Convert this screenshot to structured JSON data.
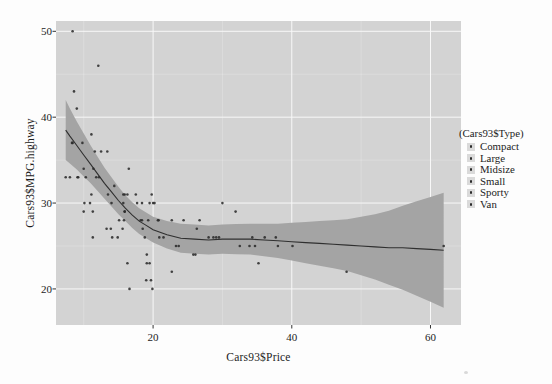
{
  "window": {
    "width": 552,
    "height": 384,
    "background": "#fdfdfd"
  },
  "chart_data": {
    "type": "scatter",
    "title": "",
    "xlabel": "Cars93$Price",
    "ylabel": "Cars93$MPG.highway",
    "xlim": [
      6.0,
      64.4
    ],
    "ylim": [
      15.8,
      51.2
    ],
    "x_ticks": [
      20,
      40,
      60
    ],
    "y_ticks": [
      20,
      30,
      40,
      50
    ],
    "x_minor_ticks": [
      10,
      30,
      50
    ],
    "y_minor_ticks": [
      25,
      35,
      45
    ],
    "grid": "white major gridlines and faint minor gridlines on gray panel",
    "legend": {
      "title": "(Cars93$Type)",
      "position": "right",
      "items": [
        "Compact",
        "Large",
        "Midsize",
        "Small",
        "Sporty",
        "Van"
      ]
    },
    "point_columns": [
      "price",
      "mpg_highway",
      "type"
    ],
    "points": [
      [
        15.9,
        31,
        "Small"
      ],
      [
        33.9,
        25,
        "Midsize"
      ],
      [
        29.1,
        26,
        "Compact"
      ],
      [
        37.7,
        26,
        "Midsize"
      ],
      [
        30,
        30,
        "Midsize"
      ],
      [
        15.7,
        31,
        "Midsize"
      ],
      [
        20.8,
        28,
        "Large"
      ],
      [
        23.7,
        25,
        "Large"
      ],
      [
        26.3,
        27,
        "Midsize"
      ],
      [
        34.7,
        25,
        "Large"
      ],
      [
        40.1,
        25,
        "Midsize"
      ],
      [
        13.4,
        36,
        "Compact"
      ],
      [
        11.4,
        34,
        "Compact"
      ],
      [
        15.1,
        28,
        "Sporty"
      ],
      [
        15.9,
        29,
        "Midsize"
      ],
      [
        16.3,
        23,
        "Van"
      ],
      [
        16.6,
        20,
        "Van"
      ],
      [
        18.8,
        26,
        "Large"
      ],
      [
        38,
        25,
        "Sporty"
      ],
      [
        18.4,
        28,
        "Large"
      ],
      [
        15.8,
        28,
        "Compact"
      ],
      [
        29.5,
        26,
        "Large"
      ],
      [
        9.2,
        33,
        "Small"
      ],
      [
        11.3,
        29,
        "Small"
      ],
      [
        13.3,
        27,
        "Compact"
      ],
      [
        19,
        21,
        "Van"
      ],
      [
        15.6,
        27,
        "Midsize"
      ],
      [
        25.8,
        24,
        "Sporty"
      ],
      [
        12.2,
        33,
        "Small"
      ],
      [
        19.3,
        28,
        "Large"
      ],
      [
        7.4,
        33,
        "Small"
      ],
      [
        10.1,
        30,
        "Small"
      ],
      [
        11.3,
        26,
        "Compact"
      ],
      [
        15.9,
        29,
        "Sporty"
      ],
      [
        14,
        30,
        "Sporty"
      ],
      [
        19.9,
        20,
        "Van"
      ],
      [
        20.2,
        30,
        "Midsize"
      ],
      [
        20.9,
        26,
        "Large"
      ],
      [
        8.4,
        50,
        "Small"
      ],
      [
        12.5,
        36,
        "Sporty"
      ],
      [
        19.8,
        31,
        "Sporty"
      ],
      [
        12.1,
        46,
        "Small"
      ],
      [
        17.5,
        31,
        "Compact"
      ],
      [
        8,
        33,
        "Small"
      ],
      [
        10,
        29,
        "Small"
      ],
      [
        10,
        34,
        "Sporty"
      ],
      [
        13.9,
        27,
        "Midsize"
      ],
      [
        47.9,
        22,
        "Midsize"
      ],
      [
        28,
        26,
        "Midsize"
      ],
      [
        35.2,
        23,
        "Midsize"
      ],
      [
        34.3,
        26,
        "Midsize"
      ],
      [
        36.1,
        26,
        "Large"
      ],
      [
        8.3,
        37,
        "Small"
      ],
      [
        11.6,
        36,
        "Small"
      ],
      [
        16.5,
        34,
        "Compact"
      ],
      [
        19.1,
        24,
        "Van"
      ],
      [
        32.5,
        25,
        "Sporty"
      ],
      [
        31.9,
        29,
        "Compact"
      ],
      [
        61.9,
        25,
        "Midsize"
      ],
      [
        14.1,
        26,
        "Sporty"
      ],
      [
        14.9,
        26,
        "Midsize"
      ],
      [
        10.3,
        33,
        "Small"
      ],
      [
        26.1,
        24,
        "Midsize"
      ],
      [
        11.8,
        33,
        "Small"
      ],
      [
        15.7,
        30,
        "Compact"
      ],
      [
        19.1,
        23,
        "Van"
      ],
      [
        21.5,
        26,
        "Midsize"
      ],
      [
        13.5,
        31,
        "Compact"
      ],
      [
        16.3,
        31,
        "Midsize"
      ],
      [
        19.5,
        23,
        "Van"
      ],
      [
        20.7,
        28,
        "Large"
      ],
      [
        14.4,
        32,
        "Sporty"
      ],
      [
        9,
        41,
        "Small"
      ],
      [
        11.1,
        31,
        "Compact"
      ],
      [
        17.7,
        30,
        "Sporty"
      ],
      [
        18.5,
        27,
        "Midsize"
      ],
      [
        24.4,
        28,
        "Large"
      ],
      [
        28.7,
        26,
        "Compact"
      ],
      [
        11.1,
        38,
        "Small"
      ],
      [
        8.4,
        37,
        "Small"
      ],
      [
        10.9,
        30,
        "Small"
      ],
      [
        19.5,
        30,
        "Compact"
      ],
      [
        8.6,
        43,
        "Small"
      ],
      [
        9.8,
        37,
        "Small"
      ],
      [
        18.4,
        30,
        "Sporty"
      ],
      [
        18.2,
        28,
        "Midsize"
      ],
      [
        22.7,
        22,
        "Van"
      ],
      [
        9.1,
        33,
        "Small"
      ],
      [
        19.7,
        21,
        "Van"
      ],
      [
        20,
        30,
        "Compact"
      ],
      [
        23.3,
        25,
        "Sporty"
      ],
      [
        22.7,
        28,
        "Compact"
      ],
      [
        26.7,
        28,
        "Midsize"
      ]
    ],
    "smooth": {
      "label": "loess fit with confidence band",
      "x": [
        7.4,
        8,
        9,
        10,
        11,
        12,
        13,
        14,
        15,
        16,
        17,
        18,
        19,
        20,
        22,
        24,
        26,
        28,
        30,
        32,
        34,
        36,
        38,
        40,
        42,
        44,
        46,
        48,
        50,
        52,
        54,
        56,
        58,
        60,
        61.9
      ],
      "y": [
        38.5,
        37.8,
        36.7,
        35.6,
        34.5,
        33.4,
        32.3,
        31.3,
        30.3,
        29.4,
        28.6,
        27.9,
        27.4,
        26.9,
        26.3,
        25.9,
        25.8,
        25.7,
        25.8,
        25.8,
        25.8,
        25.7,
        25.6,
        25.5,
        25.4,
        25.3,
        25.2,
        25.1,
        25.0,
        24.9,
        24.8,
        24.8,
        24.7,
        24.6,
        24.5
      ],
      "upper": [
        42.0,
        41.0,
        39.5,
        38.1,
        36.7,
        35.4,
        34.1,
        33.0,
        31.9,
        30.9,
        30.1,
        29.4,
        28.9,
        28.4,
        27.9,
        27.6,
        27.5,
        27.4,
        27.5,
        27.55,
        27.6,
        27.6,
        27.6,
        27.7,
        27.8,
        27.9,
        28.0,
        28.1,
        28.4,
        28.7,
        29.1,
        29.7,
        30.2,
        30.7,
        31.2
      ],
      "lower": [
        35.0,
        34.6,
        33.9,
        33.1,
        32.3,
        31.4,
        30.5,
        29.6,
        28.7,
        27.9,
        27.1,
        26.4,
        25.9,
        25.4,
        24.7,
        24.2,
        24.1,
        24.0,
        24.1,
        24.05,
        24.0,
        23.8,
        23.6,
        23.3,
        23.0,
        22.7,
        22.4,
        22.1,
        21.6,
        21.1,
        20.5,
        19.9,
        19.2,
        18.5,
        17.8
      ]
    },
    "colors": {
      "panel": "#d3d3d3",
      "ribbon": "#a4a4a4",
      "line": "#2f2f2f",
      "point": "#2b2b2b",
      "grid_major": "#f8f8f8",
      "text": "#1c1c1c",
      "legend_key_bg": "#dadada"
    }
  }
}
